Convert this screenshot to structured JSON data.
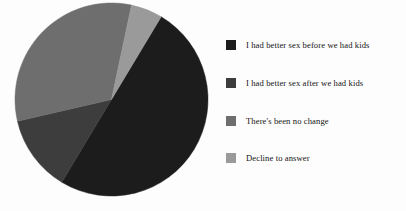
{
  "chart_data": {
    "type": "pie",
    "title": "",
    "subtitle": "",
    "xlabel": "",
    "ylabel": "",
    "grid": false,
    "legend_position": "right",
    "start_angle_deg": 12,
    "direction": "clockwise",
    "categories": [
      "I had better sex before we had kids",
      "I had better sex after we had kids",
      "There's been no change",
      "Decline to answer"
    ],
    "values": [
      50,
      13,
      32,
      5
    ],
    "unit": "%",
    "slices": [
      {
        "label": "I had better sex before we had kids",
        "value": 50,
        "color": "#1c1c1c",
        "start_deg": 31,
        "end_deg": 211
      },
      {
        "label": "I had better sex after we had kids",
        "value": 13,
        "color": "#3d3d3d",
        "start_deg": 211,
        "end_deg": 257
      },
      {
        "label": "There's been no change",
        "value": 32,
        "color": "#6e6e6e",
        "start_deg": 257,
        "end_deg": 372
      },
      {
        "label": "Decline to answer",
        "value": 5,
        "color": "#9a9a9a",
        "start_deg": 12,
        "end_deg": 31
      }
    ],
    "geometry": {
      "center_x": 97.5,
      "center_y": 97.5,
      "radius": 96.5
    }
  },
  "legend": {
    "items": [
      {
        "label": "I had better sex before we had kids",
        "color": "#1c1c1c"
      },
      {
        "label": "I had better sex after we had kids",
        "color": "#3d3d3d"
      },
      {
        "label": "There's been no change",
        "color": "#6e6e6e"
      },
      {
        "label": "Decline to answer",
        "color": "#9a9a9a"
      }
    ]
  },
  "colors": {
    "background": "#fdfdfd",
    "text": "#141414",
    "slice_1": "#1c1c1c",
    "slice_2": "#3d3d3d",
    "slice_3": "#6e6e6e",
    "slice_4": "#9a9a9a"
  }
}
